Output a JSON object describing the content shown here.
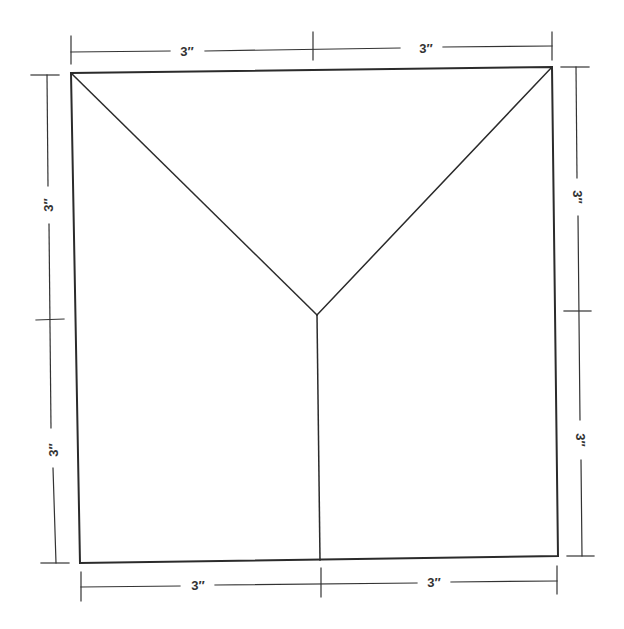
{
  "diagram": {
    "dimensions": {
      "top": [
        "3″",
        "3″"
      ],
      "bottom": [
        "3″",
        "3″"
      ],
      "left": [
        "3″",
        "3″"
      ],
      "right": [
        "3″",
        "3″"
      ]
    },
    "line_color": "#2b2b2b",
    "background": "#ffffff"
  }
}
